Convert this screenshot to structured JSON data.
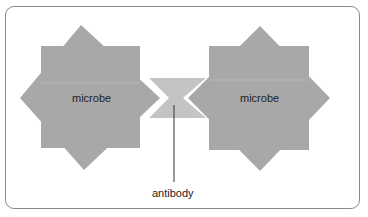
{
  "diagram": {
    "left_microbe": {
      "label": "microbe"
    },
    "right_microbe": {
      "label": "microbe"
    },
    "antibody": {
      "label": "antibody"
    },
    "colors": {
      "microbe": "#a8a8a8",
      "antibody": "#c4c4c4",
      "frame": "#8a8a8a",
      "line": "#333333"
    }
  }
}
